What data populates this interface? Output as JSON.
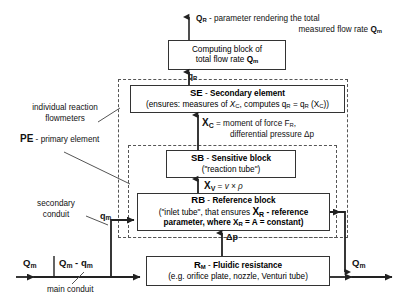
{
  "diagram": {
    "title_top": {
      "line1_prefix": "Q",
      "line1_sub": "R",
      "line1_rest": " - parameter rendering the total",
      "line2_rest": "measured flow rate ",
      "line2_sym": "Q",
      "line2_sub": "m"
    },
    "blocks": {
      "computing": {
        "line1": "Computing block of",
        "line2_pre": "total flow rate ",
        "line2_sym": "Q",
        "line2_sub": "m"
      },
      "se": {
        "code": "SE",
        "dash": " - ",
        "name": "Secondary element",
        "detail_pre": "(ensures: measures of ",
        "detail_xc": "X",
        "detail_xc_sub": "C",
        "detail_mid": ", computes q",
        "detail_qr_sub": "R",
        "detail_eq": " = q",
        "detail_qr_sub2": "R",
        "detail_paren": " (X",
        "detail_xc_sub2": "C",
        "detail_end": "))"
      },
      "sb": {
        "code": "SB",
        "dash": " - ",
        "name": "Sensitive block",
        "detail": "(\"reaction tube\")"
      },
      "rb": {
        "code": "RB",
        "dash": " - ",
        "name": "Reference block",
        "line2_pre": "(\"inlet tube\", that ensures ",
        "line2_xr": "X",
        "line2_xr_sub": "R",
        "line2_post": " - reference",
        "line3_pre": "parameter, where X",
        "line3_sub": "R",
        "line3_post": " = A = constant)"
      },
      "rm": {
        "code": "R",
        "code_sub": "M",
        "dash": " - ",
        "name": "Fluidic resistance",
        "detail": "(e.g. orifice plate, nozzle, Venturi tube)"
      }
    },
    "labels": {
      "individual_flowmeters_line1": "individual reaction",
      "individual_flowmeters_line2": "flowmeters",
      "pe_code": "PE",
      "pe_dash": " - ",
      "pe_name": "primary element",
      "secondary_conduit_line1": "secondary",
      "secondary_conduit_line2": "conduit",
      "main_conduit": "main conduit"
    },
    "signals": {
      "qr_small_sym": "q",
      "qr_small_sub": "R",
      "xc_sym": "X",
      "xc_sub": "C",
      "xc_text_pre": " =  moment of force F",
      "xc_text_sub": "R",
      "xc_text_comma": ",",
      "xc_line2": "differential pressure Δp",
      "xv_sym": "X",
      "xv_sub": "V",
      "xv_eq": " = ",
      "xv_expr": "v × ρ",
      "dp": "Δp",
      "qm_small_sym": "q",
      "qm_small_sub": "m",
      "qm_big_sym": "Q",
      "qm_big_sub": "m",
      "qm_minus_sym": "Q",
      "qm_minus_sub": "m",
      "qm_minus_rest": " - q",
      "qm_minus_sub2": "m",
      "qm_out_sym": "Q",
      "qm_out_sub": "m",
      "qm_right_sym": "Q",
      "qm_right_sub": "m"
    },
    "colors": {
      "stroke": "#333333",
      "dashed": "#555555",
      "text": "#111111",
      "background": "#ffffff"
    }
  }
}
